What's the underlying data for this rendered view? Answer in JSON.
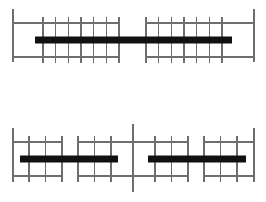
{
  "figure": {
    "type": "technical-line-drawing",
    "background_color": "#ffffff",
    "stroke_color": "#6e6e6e",
    "bar_color": "#111111",
    "width": 266,
    "height": 202,
    "panel_count": 2,
    "caption": ""
  },
  "panels": [
    {
      "id": "panel-top",
      "name": "upper-beam-diagram",
      "label": "",
      "supports": [
        {
          "name": "left-support-line",
          "x": 13,
          "y1": 9,
          "y2": 62
        },
        {
          "name": "right-support-line",
          "x": 254,
          "y1": 9,
          "y2": 62
        }
      ],
      "rails": [
        {
          "name": "upper-rail-left",
          "x1": 13,
          "x2": 119,
          "y": 23
        },
        {
          "name": "upper-rail-right",
          "x1": 146,
          "x2": 254,
          "y": 23
        },
        {
          "name": "lower-rail-left",
          "x1": 13,
          "x2": 119,
          "y": 57
        },
        {
          "name": "lower-rail-right",
          "x1": 146,
          "x2": 254,
          "y": 57
        }
      ],
      "web_groups": [
        {
          "name": "web-group-left",
          "x_start": 43,
          "x_end": 119,
          "count": 7,
          "y1": 23,
          "y2": 57
        },
        {
          "name": "web-group-right",
          "x_start": 146,
          "x_end": 222,
          "count": 7,
          "y1": 23,
          "y2": 57
        }
      ],
      "bar": {
        "name": "main-load-bar",
        "x1": 35,
        "x2": 232,
        "y": 40,
        "thickness": 7
      }
    },
    {
      "id": "panel-bottom",
      "name": "lower-beam-diagram",
      "label": "",
      "supports": [
        {
          "name": "left-support-line",
          "x": 13,
          "y1": 18,
          "y2": 72
        },
        {
          "name": "center-support-line",
          "x": 133,
          "y1": 14,
          "y2": 82
        },
        {
          "name": "right-support-line",
          "x": 254,
          "y1": 18,
          "y2": 72
        }
      ],
      "rails": [
        {
          "name": "upper-rail-a",
          "x1": 13,
          "x2": 62,
          "y": 32
        },
        {
          "name": "upper-rail-b",
          "x1": 78,
          "x2": 133,
          "y": 32
        },
        {
          "name": "upper-rail-c",
          "x1": 133,
          "x2": 188,
          "y": 32
        },
        {
          "name": "upper-rail-d",
          "x1": 204,
          "x2": 254,
          "y": 32
        },
        {
          "name": "lower-rail-a",
          "x1": 13,
          "x2": 62,
          "y": 66
        },
        {
          "name": "lower-rail-b",
          "x1": 78,
          "x2": 133,
          "y": 66
        },
        {
          "name": "lower-rail-c",
          "x1": 133,
          "x2": 188,
          "y": 66
        },
        {
          "name": "lower-rail-d",
          "x1": 204,
          "x2": 254,
          "y": 66
        }
      ],
      "web_groups": [
        {
          "name": "web-group-a",
          "x_start": 29,
          "x_end": 62,
          "count": 3,
          "y1": 32,
          "y2": 66
        },
        {
          "name": "web-group-b",
          "x_start": 78,
          "x_end": 111,
          "count": 3,
          "y1": 32,
          "y2": 66
        },
        {
          "name": "web-group-c",
          "x_start": 155,
          "x_end": 188,
          "count": 3,
          "y1": 32,
          "y2": 66
        },
        {
          "name": "web-group-d",
          "x_start": 204,
          "x_end": 237,
          "count": 3,
          "y1": 32,
          "y2": 66
        }
      ],
      "bars": [
        {
          "name": "load-bar-left",
          "x1": 20,
          "x2": 118,
          "y": 49,
          "thickness": 7
        },
        {
          "name": "load-bar-right",
          "x1": 148,
          "x2": 246,
          "y": 49,
          "thickness": 7
        }
      ]
    }
  ]
}
